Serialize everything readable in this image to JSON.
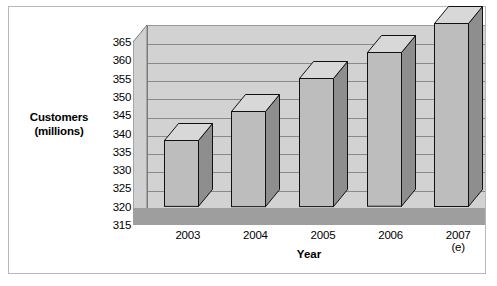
{
  "chart_data": {
    "type": "bar",
    "title": "",
    "subtitle": "",
    "xlabel": "Year",
    "ylabel": "Customers (millions)",
    "ylabel_lines": [
      "Customers",
      "(millions)"
    ],
    "categories": [
      "2003",
      "2004",
      "2005",
      "2006",
      "2007 (e)"
    ],
    "values": [
      333,
      341,
      350,
      357,
      365
    ],
    "series": [
      {
        "name": "Customers",
        "values": [
          333,
          341,
          350,
          357,
          365
        ]
      }
    ],
    "ylim": [
      315,
      365
    ],
    "ytick_step": 5,
    "yticks": [
      315,
      320,
      325,
      330,
      335,
      340,
      345,
      350,
      355,
      360,
      365
    ],
    "grid": true,
    "grid_axis": "y",
    "legend": false,
    "legend_position": "none",
    "style_3d": true,
    "colors": {
      "bar_front": "#bdbdbd",
      "bar_side": "#8e8e8e",
      "bar_top": "#d8d8d8",
      "bar_outline": "#111111",
      "wall": "#d2d2d2",
      "floor": "#9e9e9e",
      "gridline": "#8a8a8a",
      "frame_border": "#b8b8b8",
      "background": "#ffffff",
      "text": "#000000"
    }
  }
}
